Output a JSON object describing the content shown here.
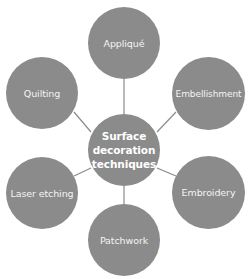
{
  "diagram": {
    "type": "hub-and-spoke",
    "colors": {
      "node_fill": "#8b8b8b",
      "node_text": "#f4f4f4",
      "connector": "#8b8b8b",
      "background": "#ffffff"
    },
    "center": {
      "label": "Surface decoration techniques",
      "lines": [
        "Surface",
        "decoration",
        "techniques"
      ]
    },
    "nodes": [
      {
        "id": "applique",
        "label": "Appliqué"
      },
      {
        "id": "embellishment",
        "label": "Embellishment"
      },
      {
        "id": "embroidery",
        "label": "Embroidery"
      },
      {
        "id": "patchwork",
        "label": "Patchwork"
      },
      {
        "id": "laser-etching",
        "label": "Laser etching"
      },
      {
        "id": "quilting",
        "label": "Quilting"
      }
    ]
  }
}
